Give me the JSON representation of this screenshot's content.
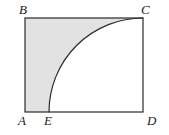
{
  "figure": {
    "canvas": {
      "width": 169,
      "height": 135,
      "background": "#ffffff"
    },
    "style": {
      "stroke_color": "#2b2b2b",
      "stroke_width": 1.2,
      "shaded_fill": "#e2e2e2",
      "unshaded_fill": "#ffffff",
      "label_color": "#1a1a1a"
    },
    "rectangle": {
      "name": "ABCD",
      "left": 25,
      "top": 18,
      "right": 143,
      "bottom": 112,
      "width": 118,
      "height": 94
    },
    "arc": {
      "type": "quarter-circle",
      "center_vertex": "D",
      "center_x": 143,
      "center_y": 112,
      "radius": 94,
      "start_point": "E",
      "start_x": 49,
      "start_y": 112,
      "end_point": "C",
      "end_x": 143,
      "end_y": 18
    },
    "shaded_region": {
      "description": "region of rectangle outside the quarter circle",
      "fill": "#e2e2e2"
    },
    "points": [
      {
        "id": "A",
        "label": "A",
        "x": 25,
        "y": 112,
        "position": "bottom-left"
      },
      {
        "id": "B",
        "label": "B",
        "x": 25,
        "y": 18,
        "position": "top-left"
      },
      {
        "id": "C",
        "label": "C",
        "x": 143,
        "y": 18,
        "position": "top-right"
      },
      {
        "id": "D",
        "label": "D",
        "x": 143,
        "y": 112,
        "position": "bottom-right"
      },
      {
        "id": "E",
        "label": "E",
        "x": 49,
        "y": 112,
        "position": "bottom-edge"
      }
    ]
  }
}
